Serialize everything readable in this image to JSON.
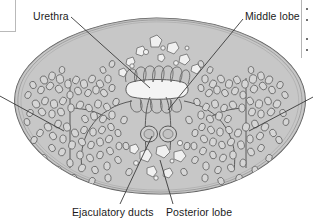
{
  "figure": {
    "kind": "anatomical-cross-section",
    "style": "grayscale line drawing, stippled glandular acini",
    "colors": {
      "stroke": "#4a4a4a",
      "capsule_fill": "#c9c9c9",
      "stroma_fill": "#c4c4c4",
      "lumen_fill": "#f2f2f2",
      "concretion_fill": "#efefef",
      "label_text": "#1b1b1b",
      "leader_line": "#3a3a3a",
      "panel_border": "#b5b5b5"
    }
  },
  "labels": {
    "urethra": "Urethra",
    "middle_lobe": "Middle lobe",
    "ejaculatory_ducts": "Ejaculatory ducts",
    "posterior_lobe": "Posterior lobe"
  },
  "leader_lines": [
    {
      "name": "urethra-leader",
      "from": [
        70,
        17
      ],
      "to": [
        150,
        88
      ]
    },
    {
      "name": "middle-lobe-leader",
      "from": [
        243,
        18
      ],
      "to": [
        168,
        110
      ]
    },
    {
      "name": "lateral-lobe-left-leader",
      "from": [
        0,
        96
      ],
      "to": [
        62,
        130
      ]
    },
    {
      "name": "lateral-lobe-right-leader",
      "from": [
        313,
        97
      ],
      "to": [
        248,
        130
      ]
    },
    {
      "name": "ejaculatory-ducts-leader",
      "from": [
        120,
        203
      ],
      "to": [
        152,
        136
      ]
    },
    {
      "name": "posterior-lobe-leader",
      "from": [
        172,
        203
      ],
      "to": [
        160,
        158
      ]
    }
  ],
  "edge_elements": {
    "corner_box": "white panel corner, cropped",
    "right_rule": "panel divider rule, cropped",
    "right_dots_count": 4
  }
}
